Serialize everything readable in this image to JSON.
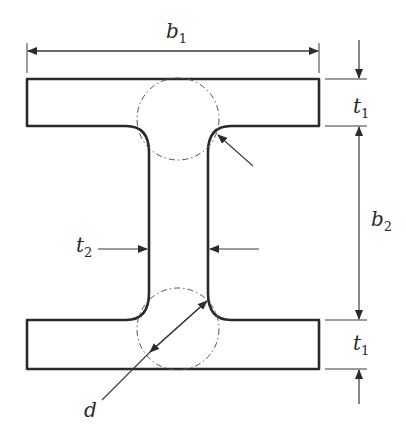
{
  "figure": {
    "type": "I-beam cross-section dimension diagram",
    "colors": {
      "outline": "#2a2a2a",
      "dim_line": "#3a3a3a",
      "background": "#ffffff"
    }
  },
  "labels": {
    "b1": {
      "base": "b",
      "sub": "1",
      "meaning": "flange width"
    },
    "b2": {
      "base": "b",
      "sub": "2",
      "meaning": "web clear height"
    },
    "t1_top": {
      "base": "t",
      "sub": "1",
      "meaning": "top flange thickness"
    },
    "t1_bottom": {
      "base": "t",
      "sub": "1",
      "meaning": "bottom flange thickness"
    },
    "t2": {
      "base": "t",
      "sub": "2",
      "meaning": "web thickness"
    },
    "d": {
      "base": "d",
      "meaning": "inscribed circle diameter at web-flange junction"
    }
  }
}
